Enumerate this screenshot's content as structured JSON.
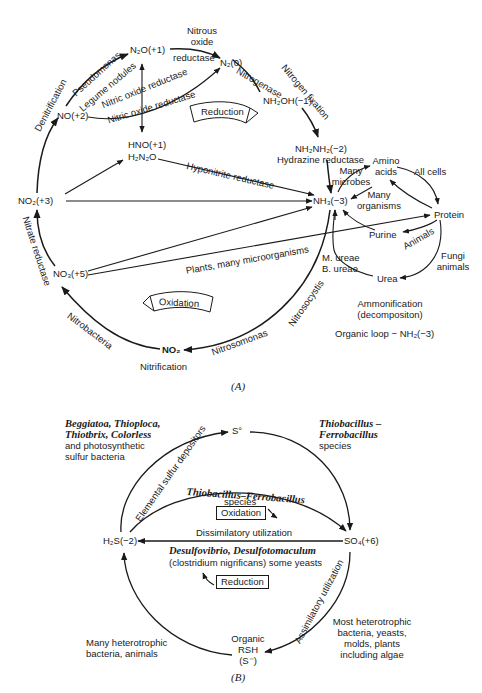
{
  "panel_a": {
    "caption": "(A)",
    "nodes": {
      "n2o": "N₂O(+1)",
      "n2": "N₂(0)",
      "no": "NO(+2)",
      "hno": "HNO(+1)",
      "h2n2o": "H₂N₂O",
      "nh2oh": "NH₂OH(−1)",
      "nh2nh2": "NH₂NH₂(−2)",
      "nh3": "NH₃(−3)",
      "no2_plus3": "NO₂(+3)",
      "no3": "NO₃(+5)",
      "no2_bottom": "NO₂",
      "amino_acids_line1": "Amino",
      "amino_acids_line2": "acids",
      "protein": "Protein",
      "purine": "Purine",
      "urea": "Urea"
    },
    "labels": {
      "nitrous_oxide_reductase_1": "Nitrous",
      "nitrous_oxide_reductase_2": "oxide",
      "nitrous_oxide_reductase_3": "reductase",
      "denitrification": "Denitrification",
      "pseudomonas": "Pseudomonas",
      "legume_nodules": "Legume nodules",
      "nitric_oxide_reductase_upper": "Nitric oxide reductase",
      "nitric_oxide_reductase_lower": "Nitric oxide reductase",
      "nitrogenase": "Nitrogenase",
      "nitrogen_fixation": "Nitrogen fixation",
      "reduction": "Reduction",
      "hydrazine_reductase": "Hydrazine reductase",
      "hyponitrite_reductase": "Hyponitrite reductase",
      "many_microbes_1": "Many",
      "many_microbes_2": "microbes",
      "many_organisms_1": "Many",
      "many_organisms_2": "organisms",
      "all_cells": "All cells",
      "animals": "Animals",
      "fungi_animals_1": "Fungi",
      "fungi_animals_2": "animals",
      "m_ureae": "M. ureae",
      "b_ureae": "B. ureae",
      "nitrate_reductase": "Nitrate reductase",
      "plants_microorganisms": "Plants, many microorganisms",
      "oxidation": "Oxidation",
      "nitrobacteria": "Nitrobacteria",
      "nitrosocystis": "Nitrosocystis",
      "nitrosomonas": "Nitrosomonas",
      "nitrification": "Nitrification",
      "ammonification_1": "Ammonification",
      "ammonification_2": "(decompositon)",
      "organic_loop": "Organic loop  −  NH₂(−3)"
    }
  },
  "panel_b": {
    "caption": "(B)",
    "nodes": {
      "s0": "S°",
      "h2s": "H₂S(−2)",
      "so4": "SO₄(+6)",
      "organic_1": "Organic",
      "organic_2": "RSH",
      "organic_3": "(S⁻)"
    },
    "labels": {
      "beggiatoa_1": "Beggiatoa, Thioploca,",
      "beggiatoa_2": "Thiotbrix, Colorless",
      "beggiatoa_3": "and photosynthetic",
      "beggiatoa_4": "sulfur bacteria",
      "thiobacillus_right_1": "Thiobacillus –",
      "thiobacillus_right_2": "Ferrobacillus",
      "thiobacillus_right_3": "species",
      "elemental_sulfur_depositors": "Elemental sulfur depositors",
      "thiobacillus_center": "Thiobacillus–Ferrobacillus",
      "species_center": "species",
      "oxidation": "Oxidation",
      "dissimilatory": "Dissimilatory utilization",
      "desulfovibrio": "Desulfovibrio, Desulfotomaculum",
      "clostridium": "(clostridium nigrificans) some yeasts",
      "reduction": "Reduction",
      "assimilatory": "Assimilatory utilization",
      "many_heterotrophic_1": "Many heterotrophic",
      "many_heterotrophic_2": "bacteria, animals",
      "most_heterotrophic_1": "Most heterotrophic",
      "most_heterotrophic_2": "bacteria, yeasts,",
      "most_heterotrophic_3": "molds, plants",
      "most_heterotrophic_4": "including algae"
    }
  }
}
